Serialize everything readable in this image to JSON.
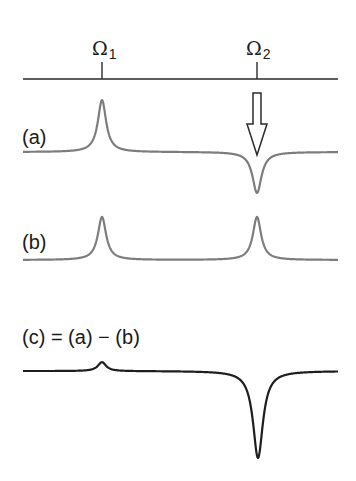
{
  "axis": {
    "markers": [
      {
        "symbol": "Ω",
        "subscript": "1",
        "x": 102
      },
      {
        "symbol": "Ω",
        "subscript": "2",
        "x": 257
      }
    ],
    "y": 79,
    "x_start": 23,
    "x_end": 338
  },
  "labels": {
    "a": "(a)",
    "b": "(b)",
    "c": "(c) = (a) − (b)"
  },
  "arrow": {
    "description": "hollow down arrow marking saturated resonance at Ω2",
    "x": 257
  },
  "colors": {
    "trace_gray": "#7d7d7d",
    "trace_black": "#1e1e1e",
    "axis": "#2a2a2a",
    "text": "#1a1a1a"
  },
  "chart_data": {
    "type": "line",
    "title": "",
    "xlabel": "",
    "ylabel": "",
    "x_ticks": [
      "Ω1",
      "Ω2"
    ],
    "x_range": [
      23,
      338
    ],
    "annotations": [
      "hollow arrow above (a) at Ω2",
      "(c) = (a) − (b)"
    ],
    "series": [
      {
        "name": "(a)",
        "color": "#7d7d7d",
        "baseline_y": 152,
        "lines": [
          {
            "center_x": 102,
            "amplitude": 52,
            "width": 5
          },
          {
            "center_x": 257,
            "amplitude": -41,
            "width": 5.5
          }
        ]
      },
      {
        "name": "(b)",
        "color": "#7d7d7d",
        "baseline_y": 260,
        "lines": [
          {
            "center_x": 102,
            "amplitude": 43,
            "width": 5
          },
          {
            "center_x": 257,
            "amplitude": 43,
            "width": 5
          }
        ]
      },
      {
        "name": "(c) = (a) − (b)",
        "color": "#1e1e1e",
        "baseline_y": 371,
        "lines": [
          {
            "center_x": 102,
            "amplitude": 9,
            "width": 5
          },
          {
            "center_x": 258,
            "amplitude": -87,
            "width": 6
          }
        ]
      }
    ]
  }
}
